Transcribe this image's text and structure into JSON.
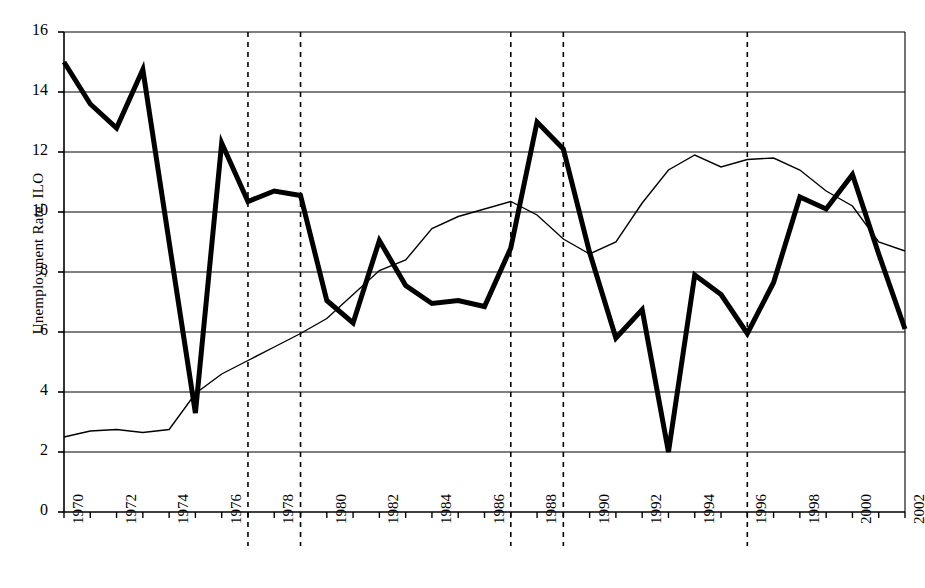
{
  "chart_data": {
    "type": "line",
    "title": "",
    "xlabel": "",
    "ylabel": "Unemployment Rate, ILO",
    "xlim": [
      1970,
      2002
    ],
    "ylim": [
      0,
      16
    ],
    "ytick_step": 2,
    "yticks": [
      0,
      2,
      4,
      6,
      8,
      10,
      12,
      14,
      16
    ],
    "xticks": [
      1970,
      1971,
      1972,
      1973,
      1974,
      1975,
      1976,
      1977,
      1978,
      1979,
      1980,
      1981,
      1982,
      1983,
      1984,
      1985,
      1986,
      1987,
      1988,
      1989,
      1990,
      1991,
      1992,
      1993,
      1994,
      1995,
      1996,
      1997,
      1998,
      1999,
      2000,
      2001,
      2002
    ],
    "xtick_labels": [
      "1970",
      "",
      "1972",
      "",
      "1974",
      "",
      "1976",
      "",
      "1978",
      "",
      "1980",
      "",
      "1982",
      "",
      "1984",
      "",
      "1986",
      "",
      "1988",
      "",
      "1990",
      "",
      "1992",
      "",
      "1994",
      "",
      "1996",
      "",
      "1998",
      "",
      "2000",
      "",
      "2002"
    ],
    "grid": "horizontal",
    "legend": "none",
    "x": [
      1970,
      1971,
      1972,
      1973,
      1974,
      1975,
      1976,
      1977,
      1978,
      1979,
      1980,
      1981,
      1982,
      1983,
      1984,
      1985,
      1986,
      1987,
      1988,
      1989,
      1990,
      1991,
      1992,
      1993,
      1994,
      1995,
      1996,
      1997,
      1998,
      1999,
      2000,
      2001,
      2002
    ],
    "series": [
      {
        "name": "bold-series",
        "style": "thick-solid",
        "color": "#000000",
        "width": 5,
        "values": [
          15.0,
          13.6,
          12.8,
          14.75,
          9.0,
          3.3,
          12.3,
          10.35,
          10.7,
          10.55,
          7.05,
          6.3,
          9.05,
          7.55,
          6.95,
          7.05,
          6.85,
          8.8,
          13.0,
          12.1,
          8.65,
          5.8,
          6.75,
          2.0,
          7.9,
          7.25,
          5.95,
          7.65,
          10.5,
          10.1,
          11.25,
          8.6,
          6.1
        ]
      },
      {
        "name": "thin-series",
        "style": "thin-solid",
        "color": "#000000",
        "width": 1.4,
        "values": [
          2.5,
          2.7,
          2.75,
          2.65,
          2.75,
          3.95,
          4.6,
          5.05,
          5.5,
          5.95,
          6.45,
          7.25,
          8.05,
          8.4,
          9.45,
          9.85,
          10.1,
          10.35,
          9.9,
          9.1,
          8.6,
          9.0,
          10.3,
          11.4,
          11.9,
          11.5,
          11.75,
          11.8,
          11.4,
          10.7,
          10.2,
          9.0,
          8.7
        ]
      }
    ],
    "vertical_markers": [
      {
        "name": "marker-1977",
        "x": 1977,
        "style": "dashed"
      },
      {
        "name": "marker-1979",
        "x": 1979,
        "style": "dashed"
      },
      {
        "name": "marker-1987",
        "x": 1987,
        "style": "dashed"
      },
      {
        "name": "marker-1989",
        "x": 1989,
        "style": "dashed"
      },
      {
        "name": "marker-1996",
        "x": 1996,
        "style": "dashed"
      }
    ]
  }
}
